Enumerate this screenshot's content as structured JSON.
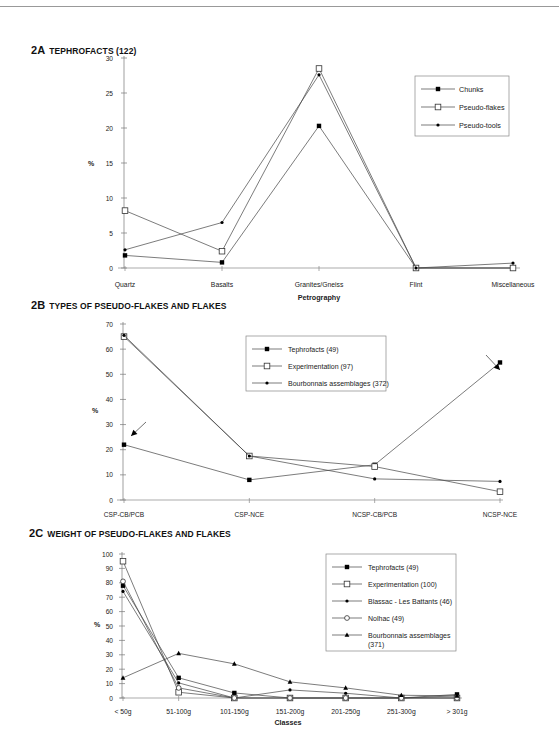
{
  "chart_data": [
    {
      "id": "2A",
      "type": "line",
      "title_num": "2A",
      "title": "TEPHROFACTS (122)",
      "xlabel": "Petrography",
      "ylabel": "%",
      "ylim": [
        0,
        30
      ],
      "yticks": [
        0,
        5,
        10,
        15,
        20,
        25,
        30
      ],
      "categories": [
        "Quartz",
        "Basalts",
        "Granites/Gneiss",
        "Flint",
        "Miscellaneous"
      ],
      "series": [
        {
          "name": "Chunks",
          "marker": "filled-square",
          "values": [
            1.8,
            0.8,
            20.3,
            0,
            0
          ]
        },
        {
          "name": "Pseudo-flakes",
          "marker": "open-square",
          "values": [
            8.2,
            2.4,
            28.5,
            0,
            0
          ]
        },
        {
          "name": "Pseudo-tools",
          "marker": "filled-dot",
          "values": [
            2.6,
            6.5,
            27.6,
            0,
            0.7
          ]
        }
      ],
      "legend_position": "upper right",
      "grid": false
    },
    {
      "id": "2B",
      "type": "line",
      "title_num": "2B",
      "title": "TYPES OF PSEUDO-FLAKES AND FLAKES",
      "xlabel": "",
      "ylabel": "%",
      "ylim": [
        0,
        70
      ],
      "yticks": [
        0,
        10,
        20,
        30,
        40,
        50,
        60,
        70
      ],
      "categories": [
        "CSP-CB/PCB",
        "CSP-NCE",
        "NCSP-CB/PCB",
        "NCSP-NCE"
      ],
      "series": [
        {
          "name": "Tephrofacts (49)",
          "marker": "filled-square",
          "values": [
            22,
            8,
            14,
            54.7
          ]
        },
        {
          "name": "Experimentation (97)",
          "marker": "open-square",
          "values": [
            65,
            17.5,
            13.3,
            3.3
          ]
        },
        {
          "name": "Bourbonnais assemblages (372)",
          "marker": "filled-dot",
          "values": [
            65.5,
            17.5,
            8.4,
            7.4
          ]
        }
      ],
      "annotations": [
        "arrow pointing to Tephrofacts at CSP-CB/PCB",
        "arrow pointing to Tephrofacts at NCSP-NCE"
      ],
      "legend_position": "upper center",
      "grid": false
    },
    {
      "id": "2C",
      "type": "line",
      "title_num": "2C",
      "title": "WEIGHT OF PSEUDO-FLAKES AND FLAKES",
      "xlabel": "Classes",
      "ylabel": "%",
      "ylim": [
        0,
        100
      ],
      "yticks": [
        0,
        10,
        20,
        30,
        40,
        50,
        60,
        70,
        80,
        90,
        100
      ],
      "categories": [
        "< 50g",
        "51-100g",
        "101-150g",
        "151-200g",
        "201-250g",
        "251-300g",
        "> 301g"
      ],
      "series": [
        {
          "name": "Tephrofacts (49)",
          "marker": "filled-square",
          "values": [
            78,
            14,
            3.5,
            0,
            0,
            0,
            2.5
          ]
        },
        {
          "name": "Experimentation (100)",
          "marker": "open-square",
          "values": [
            95,
            4,
            0,
            0,
            0,
            0,
            0
          ]
        },
        {
          "name": "Blassac - Les Battants (46)",
          "marker": "filled-dot",
          "values": [
            74,
            10.5,
            0,
            5.6,
            3.3,
            0,
            1.5
          ]
        },
        {
          "name": "Nolhac (49)",
          "marker": "open-circle",
          "values": [
            81,
            7,
            0,
            0,
            0,
            0,
            0
          ]
        },
        {
          "name": "Bourbonnais assemblages (371)",
          "marker": "filled-triangle",
          "values": [
            14,
            31,
            23.7,
            11.2,
            7,
            1.9,
            1.5
          ]
        }
      ],
      "legend_position": "upper right",
      "grid": false
    }
  ]
}
